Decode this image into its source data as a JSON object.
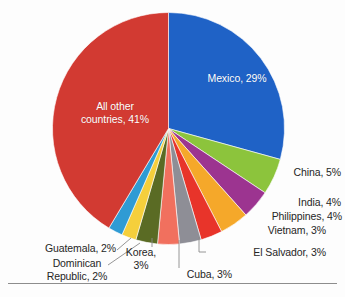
{
  "chart_data": {
    "type": "pie",
    "title": "",
    "subtitle": "",
    "xlabel": "",
    "ylabel": "",
    "legend_position": "none",
    "grid": false,
    "value_unit": "percent",
    "total": 100,
    "categories": [
      "Mexico",
      "China",
      "India",
      "Philippines",
      "Vietnam",
      "El Salvador",
      "Cuba",
      "Korea",
      "Dominican Republic",
      "Guatemala",
      "All other countries"
    ],
    "values": [
      29,
      5,
      4,
      4,
      3,
      3,
      3,
      3,
      2,
      2,
      41
    ],
    "colors": [
      "#1f62c6",
      "#8cc43c",
      "#9c3490",
      "#f5a82a",
      "#e8342a",
      "#8e8e96",
      "#f1705e",
      "#5a6b24",
      "#f5cf3c",
      "#2f9bd4",
      "#d23a32"
    ],
    "slices": [
      {
        "label": "Mexico, 29%",
        "name": "Mexico",
        "value": 29,
        "color": "#1f62c6",
        "label_placement": "inside"
      },
      {
        "label": "China, 5%",
        "name": "China",
        "value": 5,
        "color": "#8cc43c",
        "label_placement": "outside"
      },
      {
        "label": "India, 4%",
        "name": "India",
        "value": 4,
        "color": "#9c3490",
        "label_placement": "outside"
      },
      {
        "label": "Philippines, 4%",
        "name": "Philippines",
        "value": 4,
        "color": "#f5a82a",
        "label_placement": "outside"
      },
      {
        "label": "Vietnam, 3%",
        "name": "Vietnam",
        "value": 3,
        "color": "#e8342a",
        "label_placement": "outside"
      },
      {
        "label": "El Salvador, 3%",
        "name": "El Salvador",
        "value": 3,
        "color": "#8e8e96",
        "label_placement": "outside-leader"
      },
      {
        "label": "Cuba, 3%",
        "name": "Cuba",
        "value": 3,
        "color": "#f1705e",
        "label_placement": "outside-leader"
      },
      {
        "label": "Korea,\n3%",
        "name": "Korea",
        "value": 3,
        "color": "#5a6b24",
        "label_placement": "outside-leader"
      },
      {
        "label": "Dominican\nRepublic, 2%",
        "name": "Dominican Republic",
        "value": 2,
        "color": "#f5cf3c",
        "label_placement": "outside-leader"
      },
      {
        "label": "Guatemala, 2%",
        "name": "Guatemala",
        "value": 2,
        "color": "#2f9bd4",
        "label_placement": "outside-leader"
      },
      {
        "label": "All other\ncountries, 41%",
        "name": "All other countries",
        "value": 41,
        "color": "#d23a32",
        "label_placement": "inside"
      }
    ]
  },
  "labels": {
    "mexico": "Mexico, 29%",
    "all_other": "All other\ncountries, 41%",
    "china": "China, 5%",
    "india": "India, 4%",
    "philippines": "Philippines, 4%",
    "vietnam": "Vietnam, 3%",
    "el_salvador": "El Salvador, 3%",
    "cuba": "Cuba, 3%",
    "korea": "Korea,\n3%",
    "dominican": "Dominican\nRepublic, 2%",
    "guatemala": "Guatemala, 2%"
  },
  "style": {
    "inside_label_color": "#ffffff",
    "outside_label_color": "#262626",
    "leader_line_color": "#8a8a8a",
    "background": "#fdfdfd",
    "rule_color": "#8d8d8d"
  }
}
